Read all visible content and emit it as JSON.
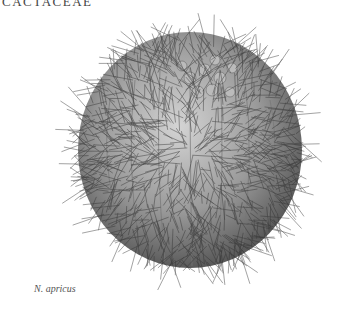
{
  "header": {
    "family_label": "CACTACEAE"
  },
  "illustration": {
    "subject": "spiny globular cactus",
    "colors": {
      "spines": "#3a3a3a",
      "body": "#9a9a9a",
      "highlight": "#d8d8d8"
    }
  },
  "caption": {
    "species": "N. apricus"
  }
}
